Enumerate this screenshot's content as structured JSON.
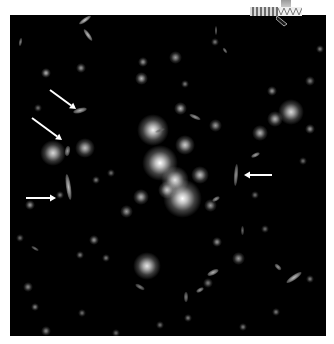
{
  "image": {
    "subject": "galaxy cluster field with gravitationally lensed arcs",
    "background_color": "#000000",
    "frame_color": "#ffffff",
    "arrow_color": "#ffffff"
  },
  "arrows": [
    {
      "id": "arrow-upper-left",
      "from": [
        40,
        75
      ],
      "to": [
        66,
        94
      ]
    },
    {
      "id": "arrow-mid-left",
      "from": [
        22,
        103
      ],
      "to": [
        52,
        125
      ]
    },
    {
      "id": "arrow-left",
      "from": [
        16,
        183
      ],
      "to": [
        46,
        183
      ]
    },
    {
      "id": "arrow-right",
      "from": [
        262,
        160
      ],
      "to": [
        234,
        160
      ]
    }
  ],
  "lensed_arcs": [
    {
      "x": 58,
      "y": 172,
      "w": 5,
      "h": 26,
      "angle": -8,
      "brightness": 0.75
    },
    {
      "x": 226,
      "y": 160,
      "w": 4,
      "h": 22,
      "angle": 4,
      "brightness": 0.6
    },
    {
      "x": 70,
      "y": 95,
      "w": 14,
      "h": 5,
      "angle": -15,
      "brightness": 0.7
    },
    {
      "x": 57,
      "y": 136,
      "w": 5,
      "h": 10,
      "angle": 10,
      "brightness": 0.6
    }
  ],
  "galaxies": [
    {
      "x": 150,
      "y": 148,
      "r": 14,
      "b": 1.0
    },
    {
      "x": 143,
      "y": 115,
      "r": 12,
      "b": 0.95
    },
    {
      "x": 165,
      "y": 165,
      "r": 11,
      "b": 0.9
    },
    {
      "x": 172,
      "y": 183,
      "r": 15,
      "b": 1.0
    },
    {
      "x": 157,
      "y": 175,
      "r": 7,
      "b": 0.8
    },
    {
      "x": 175,
      "y": 130,
      "r": 8,
      "b": 0.8
    },
    {
      "x": 190,
      "y": 160,
      "r": 7,
      "b": 0.75
    },
    {
      "x": 137,
      "y": 251,
      "r": 11,
      "b": 0.9
    },
    {
      "x": 43,
      "y": 138,
      "r": 10,
      "b": 0.85
    },
    {
      "x": 75,
      "y": 133,
      "r": 8,
      "b": 0.75
    },
    {
      "x": 281,
      "y": 97,
      "r": 10,
      "b": 0.85
    },
    {
      "x": 265,
      "y": 104,
      "r": 6,
      "b": 0.7
    },
    {
      "x": 170,
      "y": 93,
      "r": 5,
      "b": 0.7
    },
    {
      "x": 131,
      "y": 182,
      "r": 6,
      "b": 0.7
    },
    {
      "x": 116,
      "y": 196,
      "r": 5,
      "b": 0.6
    },
    {
      "x": 205,
      "y": 110,
      "r": 5,
      "b": 0.6
    },
    {
      "x": 200,
      "y": 190,
      "r": 5,
      "b": 0.6
    },
    {
      "x": 36,
      "y": 58,
      "r": 4,
      "b": 0.7
    },
    {
      "x": 71,
      "y": 53,
      "r": 4,
      "b": 0.6
    },
    {
      "x": 133,
      "y": 47,
      "r": 4,
      "b": 0.6
    },
    {
      "x": 165,
      "y": 42,
      "r": 5,
      "b": 0.6
    },
    {
      "x": 131,
      "y": 63,
      "r": 5,
      "b": 0.7
    },
    {
      "x": 175,
      "y": 69,
      "r": 3,
      "b": 0.5
    },
    {
      "x": 205,
      "y": 27,
      "r": 3,
      "b": 0.5
    },
    {
      "x": 250,
      "y": 118,
      "r": 6,
      "b": 0.7
    },
    {
      "x": 262,
      "y": 76,
      "r": 4,
      "b": 0.6
    },
    {
      "x": 300,
      "y": 114,
      "r": 4,
      "b": 0.6
    },
    {
      "x": 300,
      "y": 66,
      "r": 4,
      "b": 0.5
    },
    {
      "x": 310,
      "y": 34,
      "r": 3,
      "b": 0.5
    },
    {
      "x": 20,
      "y": 190,
      "r": 4,
      "b": 0.6
    },
    {
      "x": 84,
      "y": 225,
      "r": 4,
      "b": 0.6
    },
    {
      "x": 207,
      "y": 227,
      "r": 4,
      "b": 0.6
    },
    {
      "x": 228,
      "y": 243,
      "r": 5,
      "b": 0.6
    },
    {
      "x": 18,
      "y": 272,
      "r": 4,
      "b": 0.55
    },
    {
      "x": 25,
      "y": 292,
      "r": 3,
      "b": 0.55
    },
    {
      "x": 96,
      "y": 243,
      "r": 3,
      "b": 0.5
    },
    {
      "x": 70,
      "y": 240,
      "r": 3,
      "b": 0.5
    },
    {
      "x": 266,
      "y": 297,
      "r": 3,
      "b": 0.5
    },
    {
      "x": 300,
      "y": 264,
      "r": 3,
      "b": 0.5
    },
    {
      "x": 36,
      "y": 316,
      "r": 4,
      "b": 0.55
    },
    {
      "x": 72,
      "y": 298,
      "r": 3,
      "b": 0.45
    },
    {
      "x": 233,
      "y": 312,
      "r": 3,
      "b": 0.5
    },
    {
      "x": 198,
      "y": 268,
      "r": 4,
      "b": 0.5
    },
    {
      "x": 178,
      "y": 303,
      "r": 3,
      "b": 0.5
    },
    {
      "x": 106,
      "y": 318,
      "r": 3,
      "b": 0.45
    },
    {
      "x": 150,
      "y": 310,
      "r": 3,
      "b": 0.45
    },
    {
      "x": 28,
      "y": 93,
      "r": 3,
      "b": 0.45
    },
    {
      "x": 50,
      "y": 180,
      "r": 3,
      "b": 0.5
    },
    {
      "x": 86,
      "y": 165,
      "r": 3,
      "b": 0.5
    },
    {
      "x": 101,
      "y": 158,
      "r": 3,
      "b": 0.45
    },
    {
      "x": 245,
      "y": 180,
      "r": 3,
      "b": 0.45
    },
    {
      "x": 293,
      "y": 146,
      "r": 3,
      "b": 0.45
    },
    {
      "x": 255,
      "y": 214,
      "r": 3,
      "b": 0.45
    },
    {
      "x": 10,
      "y": 223,
      "r": 3,
      "b": 0.45
    }
  ],
  "elongated": [
    {
      "x": 75,
      "y": 5,
      "w": 14,
      "h": 4,
      "angle": -35,
      "b": 0.8
    },
    {
      "x": 78,
      "y": 20,
      "w": 14,
      "h": 4,
      "angle": 55,
      "b": 0.75
    },
    {
      "x": 10,
      "y": 27,
      "w": 3,
      "h": 8,
      "angle": 10,
      "b": 0.5
    },
    {
      "x": 215,
      "y": 35,
      "w": 6,
      "h": 3,
      "angle": 55,
      "b": 0.5
    },
    {
      "x": 206,
      "y": 15,
      "w": 2,
      "h": 9,
      "angle": 0,
      "b": 0.45
    },
    {
      "x": 284,
      "y": 262,
      "w": 18,
      "h": 5,
      "angle": -35,
      "b": 0.75
    },
    {
      "x": 268,
      "y": 252,
      "w": 8,
      "h": 4,
      "angle": 45,
      "b": 0.6
    },
    {
      "x": 203,
      "y": 257,
      "w": 12,
      "h": 5,
      "angle": -25,
      "b": 0.7
    },
    {
      "x": 190,
      "y": 275,
      "w": 8,
      "h": 4,
      "angle": -30,
      "b": 0.6
    },
    {
      "x": 130,
      "y": 272,
      "w": 10,
      "h": 4,
      "angle": 30,
      "b": 0.5
    },
    {
      "x": 206,
      "y": 184,
      "w": 8,
      "h": 4,
      "angle": -30,
      "b": 0.6
    },
    {
      "x": 185,
      "y": 102,
      "w": 12,
      "h": 4,
      "angle": 25,
      "b": 0.6
    },
    {
      "x": 245,
      "y": 140,
      "w": 9,
      "h": 4,
      "angle": -25,
      "b": 0.65
    },
    {
      "x": 25,
      "y": 233,
      "w": 8,
      "h": 3,
      "angle": 30,
      "b": 0.45
    },
    {
      "x": 176,
      "y": 282,
      "w": 4,
      "h": 10,
      "angle": 0,
      "b": 0.5
    },
    {
      "x": 232,
      "y": 215,
      "w": 3,
      "h": 9,
      "angle": 0,
      "b": 0.4
    },
    {
      "x": 150,
      "y": 115,
      "w": 10,
      "h": 3,
      "angle": -20,
      "b": 0.4
    }
  ],
  "overlay": {
    "top_right_strip": "cropped scale/orientation bar (illegible)"
  }
}
